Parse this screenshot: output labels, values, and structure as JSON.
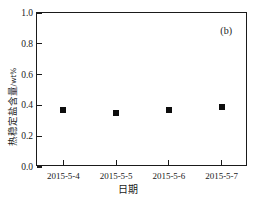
{
  "chart_data": {
    "type": "scatter",
    "title": "",
    "panel_label": "(b)",
    "xlabel": "日期",
    "ylabel": "热稳定盐含量/wt%",
    "ylabel_text": "热稳定盐含量",
    "ylabel_unit": "/wt%",
    "categories": [
      "2015-5-4",
      "2015-5-5",
      "2015-5-6",
      "2015-5-7"
    ],
    "values": [
      0.37,
      0.35,
      0.37,
      0.39
    ],
    "ylim": [
      0.0,
      1.0
    ],
    "ytick_labels": [
      "0.0",
      "0.2",
      "0.4",
      "0.6",
      "0.8",
      "1.0"
    ],
    "ytick_values": [
      0.0,
      0.2,
      0.4,
      0.6,
      0.8,
      1.0
    ],
    "grid": false,
    "legend": false,
    "marker": "filled-square",
    "marker_color": "#0d0d0d",
    "frame_color": "#1a1a1a",
    "background": "#ffffff"
  }
}
